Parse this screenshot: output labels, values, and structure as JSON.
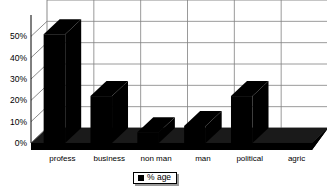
{
  "chart_data": {
    "type": "bar",
    "title": "",
    "subtitle": "",
    "xlabel": "",
    "ylabel": "",
    "categories": [
      "profess",
      "business",
      "non man",
      "man",
      "political",
      "agric"
    ],
    "series": [
      {
        "name": "% age",
        "values": [
          51,
          22,
          5,
          8,
          22,
          0
        ],
        "color": "#000000"
      }
    ],
    "ylim": [
      0,
      60
    ],
    "yticks": [
      0,
      10,
      20,
      30,
      40,
      50
    ],
    "ytick_labels": [
      "0%",
      "10%",
      "20%",
      "30%",
      "40%",
      "50%"
    ],
    "grid": true,
    "grid_axis": "y",
    "legend_position": "bottom",
    "three_d": true,
    "plot_background": "#ffffff",
    "grid_color": "#808080",
    "axis_color": "#000000",
    "floor_color": "#1a1a1a"
  },
  "legend": {
    "entries": [
      {
        "label": "% age",
        "swatch_color": "#000000"
      }
    ]
  }
}
